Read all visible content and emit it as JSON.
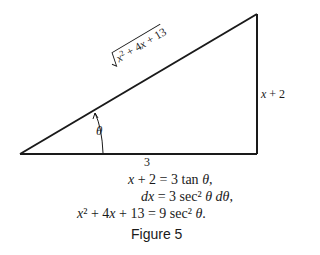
{
  "figure": {
    "caption": "Figure 5",
    "triangle": {
      "hypotenuse_label": "√(x² + 4x + 13)",
      "opposite_label": "x + 2",
      "adjacent_label": "3",
      "angle_label": "θ"
    },
    "equations": [
      {
        "lhs": "x + 2",
        "rhs": "3 tan θ,"
      },
      {
        "lhs": "dx",
        "rhs": "3 sec² θ dθ,"
      },
      {
        "lhs": "x² + 4x + 13",
        "rhs": "9 sec² θ."
      }
    ],
    "colors": {
      "line": "#1a1a1a",
      "background": "#ffffff"
    }
  }
}
